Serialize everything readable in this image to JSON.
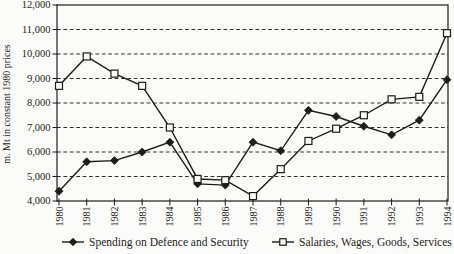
{
  "figure": {
    "background_color": "#fbfbf9",
    "ink_color": "#1d1d1b",
    "y_axis_title": "m. Mt in constant 1980 prices"
  },
  "chart_data": {
    "type": "line",
    "title": "",
    "xlabel": "",
    "ylabel": "m. Mt in constant 1980 prices",
    "ylim": [
      4000,
      12000
    ],
    "ytick_step": 1000,
    "ytick_labels": [
      "4,000",
      "5,000",
      "6,000",
      "7,000",
      "8,000",
      "9,000",
      "10,000",
      "11,000",
      "12,000"
    ],
    "grid": "horizontal-dashed",
    "legend_position": "bottom",
    "x_tick_label_rotation": 90,
    "categories": [
      "1980",
      "1981",
      "1982",
      "1983",
      "1984",
      "1985",
      "1986",
      "1987",
      "1988",
      "1989",
      "1990",
      "1991",
      "1992",
      "1993",
      "1994"
    ],
    "series": [
      {
        "name": "Spending on Defence and Security",
        "marker": "filled-diamond",
        "color": "#1d1d1b",
        "values": [
          4400,
          5600,
          5650,
          6000,
          6400,
          4700,
          4650,
          6400,
          6050,
          7700,
          7450,
          7050,
          6700,
          7300,
          8950
        ]
      },
      {
        "name": "Salaries, Wages, Goods, Services",
        "marker": "open-square",
        "color": "#1d1d1b",
        "values": [
          8700,
          9900,
          9200,
          8700,
          7000,
          4900,
          4850,
          4200,
          5300,
          6450,
          6950,
          7500,
          8150,
          8250,
          10850
        ]
      }
    ]
  }
}
